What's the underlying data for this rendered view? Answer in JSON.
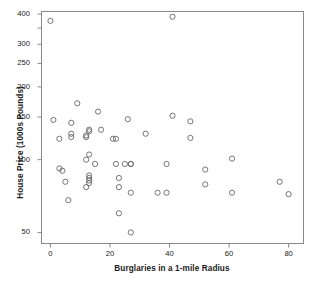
{
  "chart_data": {
    "type": "scatter",
    "title": "",
    "xlabel": "Burglaries in a 1-mile Radius",
    "ylabel": "House Price (1000s Pounds)",
    "xlim": [
      -3,
      85
    ],
    "ylim": [
      45,
      410
    ],
    "yscale": "log",
    "grid": false,
    "legend": null,
    "xticks": [
      0,
      20,
      40,
      60,
      80
    ],
    "xticklabels": [
      "0",
      "20",
      "40",
      "60",
      "80"
    ],
    "yticks": [
      50,
      100,
      150,
      200,
      250,
      300,
      400
    ],
    "yticklabels": [
      "50",
      "100",
      "150",
      "200",
      "250",
      "300",
      "400"
    ],
    "marker": {
      "shape": "circle-open",
      "edge_color": "#666666",
      "face_color": "none",
      "size": 4
    },
    "frame_color": "#8a8a8a",
    "points": [
      {
        "x": 0,
        "y": 375
      },
      {
        "x": 1,
        "y": 146
      },
      {
        "x": 3,
        "y": 122
      },
      {
        "x": 3,
        "y": 92
      },
      {
        "x": 4,
        "y": 90
      },
      {
        "x": 5,
        "y": 81
      },
      {
        "x": 6,
        "y": 68
      },
      {
        "x": 7,
        "y": 142
      },
      {
        "x": 7,
        "y": 124
      },
      {
        "x": 7,
        "y": 128
      },
      {
        "x": 9,
        "y": 171
      },
      {
        "x": 12,
        "y": 126
      },
      {
        "x": 12,
        "y": 124
      },
      {
        "x": 12,
        "y": 100
      },
      {
        "x": 12,
        "y": 77
      },
      {
        "x": 13,
        "y": 133
      },
      {
        "x": 13,
        "y": 131
      },
      {
        "x": 13,
        "y": 105
      },
      {
        "x": 13,
        "y": 86
      },
      {
        "x": 13,
        "y": 84
      },
      {
        "x": 13,
        "y": 82
      },
      {
        "x": 13,
        "y": 80
      },
      {
        "x": 15,
        "y": 96
      },
      {
        "x": 16,
        "y": 158
      },
      {
        "x": 17,
        "y": 133
      },
      {
        "x": 21,
        "y": 122
      },
      {
        "x": 22,
        "y": 122
      },
      {
        "x": 22,
        "y": 96
      },
      {
        "x": 23,
        "y": 84
      },
      {
        "x": 23,
        "y": 77
      },
      {
        "x": 23,
        "y": 60
      },
      {
        "x": 25,
        "y": 96
      },
      {
        "x": 26,
        "y": 147
      },
      {
        "x": 27,
        "y": 96
      },
      {
        "x": 27,
        "y": 96
      },
      {
        "x": 27,
        "y": 73
      },
      {
        "x": 27,
        "y": 50
      },
      {
        "x": 32,
        "y": 128
      },
      {
        "x": 36,
        "y": 73
      },
      {
        "x": 39,
        "y": 73
      },
      {
        "x": 39,
        "y": 96
      },
      {
        "x": 41,
        "y": 390
      },
      {
        "x": 41,
        "y": 152
      },
      {
        "x": 47,
        "y": 144
      },
      {
        "x": 47,
        "y": 123
      },
      {
        "x": 52,
        "y": 91
      },
      {
        "x": 52,
        "y": 79
      },
      {
        "x": 61,
        "y": 101
      },
      {
        "x": 61,
        "y": 73
      },
      {
        "x": 77,
        "y": 81
      },
      {
        "x": 80,
        "y": 72
      }
    ]
  }
}
